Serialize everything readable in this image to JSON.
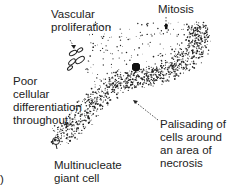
{
  "diagram": {
    "labels": {
      "vascular": "Vascular\nproliferation",
      "mitosis": "Mitosis",
      "poor": "Poor\ncellular\ndifferentiation\nthroughout",
      "palisading": "Palisading of\ncells around\nan area of\nnecrosis",
      "multinucleate": "Multinucleate\ngiant cell",
      "panel": ")"
    },
    "colors": {
      "ink": "#222222",
      "background": "#ffffff"
    }
  }
}
